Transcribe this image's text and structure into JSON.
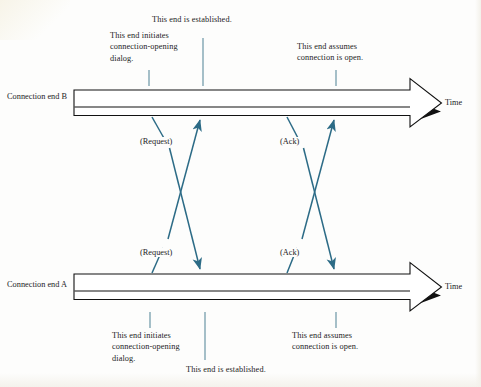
{
  "diagram": {
    "colors": {
      "message_arrow": "#2c6b86",
      "tick": "#4f7f91",
      "timeline_outline": "#1a1a1a",
      "background": "#fdfdfc",
      "text": "#1c1c1c"
    },
    "timelines": [
      {
        "id": "end-b",
        "label": "Connection\nend B",
        "time_label": "Time"
      },
      {
        "id": "end-a",
        "label": "Connection\nend A",
        "time_label": "Time"
      }
    ],
    "annotations": {
      "top": [
        {
          "id": "b-initiates",
          "text": "This end initiates\nconnection-opening\ndialog."
        },
        {
          "id": "b-established",
          "text": "This end is established."
        },
        {
          "id": "b-assumes-open",
          "text": "This end assumes\nconnection is open."
        }
      ],
      "bottom": [
        {
          "id": "a-initiates",
          "text": "This end initiates\nconnection-opening\ndialog."
        },
        {
          "id": "a-established",
          "text": "This end is established."
        },
        {
          "id": "a-assumes-open",
          "text": "This end assumes\nconnection is open."
        }
      ]
    },
    "messages": [
      {
        "id": "request-b-to-a",
        "label": "(Request)",
        "from": "end-b",
        "to": "end-a"
      },
      {
        "id": "request-a-to-b",
        "label": "(Request)",
        "from": "end-a",
        "to": "end-b"
      },
      {
        "id": "ack-b-to-a",
        "label": "(Ack)",
        "from": "end-b",
        "to": "end-a"
      },
      {
        "id": "ack-a-to-b",
        "label": "(Ack)",
        "from": "end-a",
        "to": "end-b"
      }
    ]
  }
}
